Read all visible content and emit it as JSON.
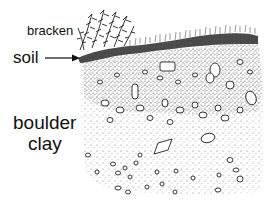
{
  "figure": {
    "type": "soil-profile-illustration",
    "labels": {
      "bracken": "bracken",
      "soil": "soil",
      "boulder": "boulder",
      "clay": "clay"
    },
    "layers": [
      {
        "name": "bracken",
        "description": "fern vegetation on surface"
      },
      {
        "name": "soil",
        "description": "thin dark topsoil band",
        "indicated_by": "arrow"
      },
      {
        "name": "boulder clay",
        "description": "stippled clay with scattered stones"
      }
    ],
    "colors": {
      "ink": "#111111",
      "background": "#ffffff",
      "soil_band": "#2a2a2a",
      "stipple": "#555555"
    }
  }
}
